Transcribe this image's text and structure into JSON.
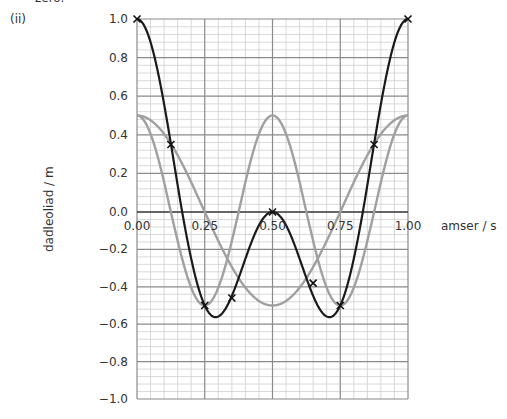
{
  "question": {
    "fragment": "zero.",
    "part": "(ii)"
  },
  "chart_data": {
    "type": "line",
    "title": "",
    "xlabel": "amser / s",
    "ylabel": "dadleoliad / m",
    "xlim": [
      0,
      1
    ],
    "ylim": [
      -1,
      1
    ],
    "grid": true,
    "x_ticks": [
      "0.00",
      "0.25",
      "0.50",
      "0.75",
      "1.00"
    ],
    "y_ticks": [
      "1.0",
      "0.8",
      "0.6",
      "0.4",
      "0.2",
      "0.0",
      "−0.2",
      "−0.4",
      "−0.6",
      "−0.8",
      "−1.0"
    ],
    "series": [
      {
        "name": "wave A (gray)",
        "color": "#a0a0a0",
        "function": "0.5*cos(2*pi*t)",
        "x": [
          0,
          0.25,
          0.5,
          0.75,
          1.0
        ],
        "values": [
          0.5,
          0.0,
          -0.5,
          0.0,
          0.5
        ]
      },
      {
        "name": "wave B (gray)",
        "color": "#a0a0a0",
        "function": "0.5*cos(4*pi*t)",
        "x": [
          0,
          0.125,
          0.25,
          0.375,
          0.5,
          0.625,
          0.75,
          0.875,
          1.0
        ],
        "values": [
          0.5,
          0.0,
          -0.5,
          0.0,
          0.5,
          0.0,
          -0.5,
          0.0,
          0.5
        ]
      },
      {
        "name": "resultant (black)",
        "color": "#1a1a1a",
        "function": "A + B",
        "x": [
          0,
          0.125,
          0.25,
          0.35,
          0.5,
          0.65,
          0.75,
          0.875,
          1.0
        ],
        "values": [
          1.0,
          0.35,
          -0.5,
          -0.46,
          0.0,
          -0.38,
          -0.5,
          0.35,
          1.0
        ],
        "markers": "x"
      }
    ]
  }
}
